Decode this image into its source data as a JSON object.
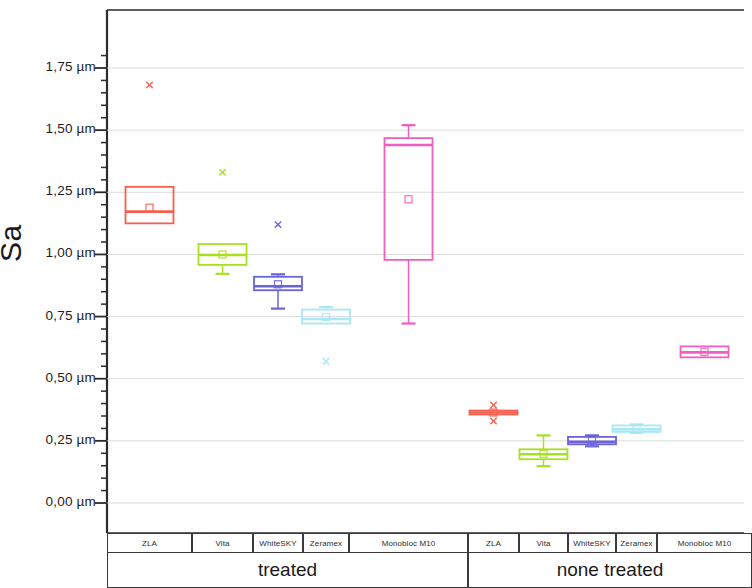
{
  "chart_data": {
    "type": "box",
    "title": "",
    "xlabel": "",
    "ylabel": "Sa",
    "ylim": [
      -0.12,
      1.85
    ],
    "y_unit": "µm",
    "grid": true,
    "decimal_separator": ",",
    "y_ticks": [
      {
        "value": 1.75,
        "label": "1,75 µm"
      },
      {
        "value": 1.5,
        "label": "1,50 µm"
      },
      {
        "value": 1.25,
        "label": "1,25 µm"
      },
      {
        "value": 1.0,
        "label": "1,00 µm"
      },
      {
        "value": 0.75,
        "label": "0,75 µm"
      },
      {
        "value": 0.5,
        "label": "0,50 µm"
      },
      {
        "value": 0.25,
        "label": "0,25 µm"
      },
      {
        "value": 0.0,
        "label": "0,00 µm"
      }
    ],
    "minor_ticks_per_major": 5,
    "groups": [
      {
        "label": "treated",
        "categories": [
          "ZLA",
          "Vita",
          "WhiteSKY",
          "Zeramex",
          "Monobloc M10"
        ]
      },
      {
        "label": "none treated",
        "categories": [
          "ZLA",
          "Vita",
          "WhiteSKY",
          "Zeramex",
          "Monobloc M10"
        ]
      }
    ],
    "series": [
      {
        "group": "treated",
        "category": "ZLA",
        "color": "#f4604f",
        "q1": 1.125,
        "median": 1.172,
        "q3": 1.272,
        "whisker_low": 1.125,
        "whisker_high": 1.272,
        "mean": 1.188,
        "outliers": [
          1.682
        ],
        "cap_low": 1.118,
        "cap_high": 1.283
      },
      {
        "group": "treated",
        "category": "Vita",
        "color": "#a8e020",
        "q1": 0.958,
        "median": 0.998,
        "q3": 1.042,
        "whisker_low": 0.922,
        "whisker_high": 1.042,
        "mean": 1.0,
        "outliers": [
          1.33
        ],
        "cap_low": 0.922,
        "cap_high": 1.052
      },
      {
        "group": "treated",
        "category": "WhiteSKY",
        "color": "#6a64d8",
        "q1": 0.856,
        "median": 0.872,
        "q3": 0.91,
        "whisker_low": 0.782,
        "whisker_high": 0.916,
        "mean": 0.88,
        "outliers": [
          1.12
        ],
        "cap_low": 0.782,
        "cap_high": 0.92
      },
      {
        "group": "treated",
        "category": "Zeramex",
        "color": "#a8e8f4",
        "q1": 0.722,
        "median": 0.74,
        "q3": 0.778,
        "whisker_low": 0.722,
        "whisker_high": 0.786,
        "mean": 0.748,
        "outliers": [
          0.57
        ],
        "cap_low": 0.716,
        "cap_high": 0.788
      },
      {
        "group": "treated",
        "category": "Monobloc M10",
        "color": "#f05fc0",
        "q1": 0.978,
        "median": 1.44,
        "q3": 1.468,
        "whisker_low": 0.722,
        "whisker_high": 1.52,
        "mean": 1.222,
        "outliers": [],
        "cap_low": 0.722,
        "cap_high": 1.52
      },
      {
        "group": "none treated",
        "category": "ZLA",
        "color": "#f4604f",
        "q1": 0.356,
        "median": 0.364,
        "q3": 0.372,
        "whisker_low": 0.356,
        "whisker_high": 0.372,
        "mean": 0.364,
        "outliers": [
          0.394,
          0.33
        ],
        "cap_low": 0.356,
        "cap_high": 0.372
      },
      {
        "group": "none treated",
        "category": "Vita",
        "color": "#a8e020",
        "q1": 0.176,
        "median": 0.196,
        "q3": 0.216,
        "whisker_low": 0.148,
        "whisker_high": 0.272,
        "mean": 0.198,
        "outliers": [],
        "cap_low": 0.148,
        "cap_high": 0.272
      },
      {
        "group": "none treated",
        "category": "WhiteSKY",
        "color": "#6a64d8",
        "q1": 0.236,
        "median": 0.246,
        "q3": 0.266,
        "whisker_low": 0.228,
        "whisker_high": 0.272,
        "mean": 0.252,
        "outliers": [],
        "cap_low": 0.228,
        "cap_high": 0.272
      },
      {
        "group": "none treated",
        "category": "Zeramex",
        "color": "#a8e8f4",
        "q1": 0.286,
        "median": 0.296,
        "q3": 0.312,
        "whisker_low": 0.282,
        "whisker_high": 0.316,
        "mean": 0.298,
        "outliers": [],
        "cap_low": 0.282,
        "cap_high": 0.316
      },
      {
        "group": "none treated",
        "category": "Monobloc M10",
        "color": "#f05fc0",
        "q1": 0.586,
        "median": 0.606,
        "q3": 0.63,
        "whisker_low": 0.586,
        "whisker_high": 0.63,
        "mean": 0.608,
        "outliers": [],
        "cap_low": 0.586,
        "cap_high": 0.63
      }
    ]
  }
}
